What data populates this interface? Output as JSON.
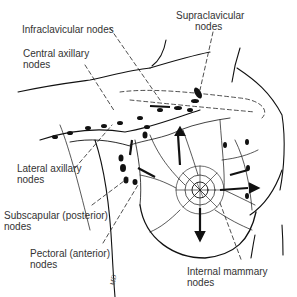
{
  "diagram": {
    "labels": {
      "infraclavicular": "Infraclavicular nodes",
      "central_axillary_1": "Central axillary",
      "central_axillary_2": "nodes",
      "supraclavicular_1": "Supraclavicular",
      "supraclavicular_2": "nodes",
      "lateral_axillary_1": "Lateral axillary",
      "lateral_axillary_2": "nodes",
      "subscapular_1": "Subscapular (posterior)",
      "subscapular_2": "nodes",
      "pectoral_1": "Pectoral (anterior)",
      "pectoral_2": "nodes",
      "internal_mammary_1": "Internal mammary",
      "internal_mammary_2": "nodes"
    },
    "artist_mark": "MD"
  }
}
